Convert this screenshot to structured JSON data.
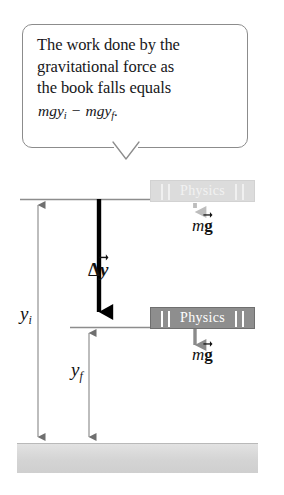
{
  "figure": {
    "name": "work-done-by-gravity-diagram",
    "background_color": "#ffffff"
  },
  "callout": {
    "border_color": "#8c8c8c",
    "line1": "The work done by the",
    "line2": "gravitational force as",
    "line3": "the book falls equals",
    "formula": {
      "term1_base": "mgy",
      "term1_sub": "i",
      "operator": "−",
      "term2_base": "mgy",
      "term2_sub": "f",
      "period": ".",
      "full_text": "mgy_i − mgy_f."
    }
  },
  "books": {
    "upper": {
      "title": "Physics",
      "state": "initial-position-ghost",
      "fill_color": "#dcdcdc",
      "text_color": "#f2f2f2"
    },
    "lower": {
      "title": "Physics",
      "state": "final-position-solid",
      "fill_color": "#8e8e8e",
      "text_color": "#ffffff"
    }
  },
  "vectors": {
    "displacement": {
      "base": "Δy",
      "symbol": "Δ",
      "variable": "y",
      "style": "thick-solid-black-arrow",
      "color": "#000000"
    },
    "weight_upper": {
      "prefix": "m",
      "variable": "g",
      "label": "mg",
      "style": "dashed-gray-arrow",
      "color": "#a8a8a8"
    },
    "weight_lower": {
      "prefix": "m",
      "variable": "g",
      "label": "mg",
      "style": "solid-gray-arrow",
      "color": "#8a8a8a"
    }
  },
  "measurements": {
    "initial_height": {
      "base": "y",
      "sub": "i",
      "label": "y_i",
      "style": "double-headed-thin-arrow",
      "color": "#8a8a8a"
    },
    "final_height": {
      "base": "y",
      "sub": "f",
      "label": "y_f",
      "style": "double-headed-thin-arrow",
      "color": "#8a8a8a"
    }
  },
  "ground": {
    "label": "ground-surface",
    "fill_color": "#d6d6d6",
    "edge_color": "#b9b9b9"
  }
}
